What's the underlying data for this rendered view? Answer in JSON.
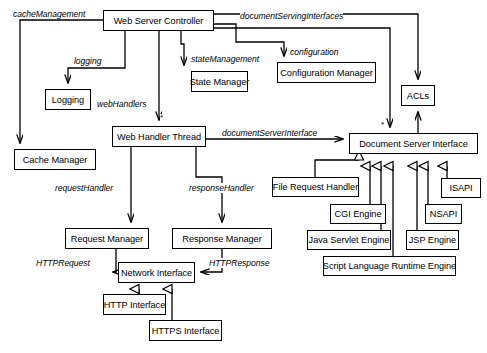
{
  "diagram": {
    "type": "uml-class-diagram",
    "canvas": {
      "width": 487,
      "height": 353
    },
    "stroke_color": "#000000",
    "background_color": "#ffffff",
    "nodes": [
      {
        "id": "web-server-controller",
        "label": "Web Server Controller",
        "x": 103,
        "y": 10,
        "w": 111,
        "h": 21
      },
      {
        "id": "logging",
        "label": "Logging",
        "x": 45,
        "y": 89,
        "w": 46,
        "h": 21
      },
      {
        "id": "cache-manager",
        "label": "Cache Manager",
        "x": 14,
        "y": 149,
        "w": 82,
        "h": 21
      },
      {
        "id": "state-manager",
        "label": "State Manager",
        "x": 191,
        "y": 71,
        "w": 57,
        "h": 21
      },
      {
        "id": "configuration-manager",
        "label": "Configuration Manager",
        "x": 277,
        "y": 62,
        "w": 99,
        "h": 21
      },
      {
        "id": "acls",
        "label": "ACLs",
        "x": 401,
        "y": 85,
        "w": 34,
        "h": 21
      },
      {
        "id": "web-handler-thread",
        "label": "Web Handler Thread",
        "x": 112,
        "y": 126,
        "w": 94,
        "h": 21
      },
      {
        "id": "document-server-interface",
        "label": "Document Server Interface",
        "x": 349,
        "y": 133,
        "w": 129,
        "h": 21
      },
      {
        "id": "file-request-handler",
        "label": "File Request Handler",
        "x": 272,
        "y": 177,
        "w": 87,
        "h": 20
      },
      {
        "id": "cgi-engine",
        "label": "CGI Engine",
        "x": 330,
        "y": 204,
        "w": 56,
        "h": 20
      },
      {
        "id": "java-servlet-engine",
        "label": "Java Servlet Engine",
        "x": 307,
        "y": 230,
        "w": 84,
        "h": 20
      },
      {
        "id": "jsp-engine",
        "label": "JSP Engine",
        "x": 406,
        "y": 230,
        "w": 53,
        "h": 20
      },
      {
        "id": "nsapi",
        "label": "NSAPI",
        "x": 425,
        "y": 204,
        "w": 37,
        "h": 20
      },
      {
        "id": "isapi",
        "label": "ISAPI",
        "x": 441,
        "y": 178,
        "w": 40,
        "h": 20
      },
      {
        "id": "script-language-runtime-engine",
        "label": "Script Language Runtime Engine",
        "x": 323,
        "y": 256,
        "w": 133,
        "h": 20
      },
      {
        "id": "request-manager",
        "label": "Request Manager",
        "x": 65,
        "y": 228,
        "w": 84,
        "h": 21
      },
      {
        "id": "response-manager",
        "label": "Response Manager",
        "x": 172,
        "y": 228,
        "w": 100,
        "h": 21
      },
      {
        "id": "network-interface",
        "label": "Network Interface",
        "x": 118,
        "y": 262,
        "w": 77,
        "h": 21
      },
      {
        "id": "http-interface",
        "label": "HTTP Interface",
        "x": 103,
        "y": 294,
        "w": 63,
        "h": 21
      },
      {
        "id": "https-interface",
        "label": "HTTPS Interface",
        "x": 149,
        "y": 320,
        "w": 73,
        "h": 21
      }
    ],
    "edge_labels": [
      {
        "id": "cache-management",
        "text": "cacheManagement",
        "x": 13,
        "y": 9
      },
      {
        "id": "logging-label",
        "text": "logging",
        "x": 74,
        "y": 56
      },
      {
        "id": "web-handlers",
        "text": "webHandlers",
        "x": 97,
        "y": 99
      },
      {
        "id": "state-management",
        "text": "stateManagement",
        "x": 191,
        "y": 54
      },
      {
        "id": "configuration",
        "text": "configuration",
        "x": 290,
        "y": 47
      },
      {
        "id": "document-serving-interfaces",
        "text": "documentServingInterfaces",
        "x": 240,
        "y": 11
      },
      {
        "id": "document-server-interface-label",
        "text": "documentServerInterface",
        "x": 222,
        "y": 128
      },
      {
        "id": "request-handler",
        "text": "requestHandler",
        "x": 55,
        "y": 183
      },
      {
        "id": "response-handler",
        "text": "responseHandler",
        "x": 189,
        "y": 183
      },
      {
        "id": "http-request",
        "text": "HTTPRequest",
        "x": 36,
        "y": 258
      },
      {
        "id": "http-response",
        "text": "HTTPResponse",
        "x": 209,
        "y": 258
      }
    ],
    "multiplicities": [
      {
        "id": "web-handler-thread-multiplicity",
        "text": "*",
        "x": 160,
        "y": 114
      },
      {
        "id": "document-server-interface-multiplicity",
        "text": "*",
        "x": 381,
        "y": 121
      }
    ]
  }
}
